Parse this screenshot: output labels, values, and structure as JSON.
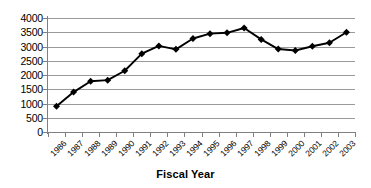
{
  "chart_data": {
    "type": "line",
    "title": "",
    "xlabel": "Fiscal Year",
    "ylabel": "",
    "categories": [
      "1986",
      "1987",
      "1988",
      "1989",
      "1990",
      "1991",
      "1992",
      "1993",
      "1994",
      "1995",
      "1996",
      "1997",
      "1998",
      "1999",
      "2000",
      "2001",
      "2002",
      "2003"
    ],
    "values": [
      900,
      1400,
      1780,
      1820,
      2150,
      2750,
      3020,
      2900,
      3280,
      3450,
      3480,
      3650,
      3250,
      2910,
      2860,
      3010,
      3130,
      3500
    ],
    "series": [
      {
        "name": "Fiscal Year Series",
        "values": [
          900,
          1400,
          1780,
          1820,
          2150,
          2750,
          3020,
          2900,
          3280,
          3450,
          3480,
          3650,
          3250,
          2910,
          2860,
          3010,
          3130,
          3500
        ]
      }
    ],
    "ylim": [
      0,
      4000
    ],
    "y_ticks": [
      0,
      500,
      1000,
      1500,
      2000,
      2500,
      3000,
      3500,
      4000
    ],
    "y_tick_labels": [
      "0",
      "500",
      "1000",
      "1500",
      "2000",
      "2500",
      "3000",
      "3500",
      "4000"
    ],
    "grid": true,
    "grid_axis": "y",
    "legend": false,
    "legend_position": "none",
    "marker": "diamond",
    "marker_color": "#000000",
    "line_color": "#000000",
    "plot_background": "#ffffff",
    "grid_color": "#9a9a9a",
    "axis_color": "#808080"
  }
}
